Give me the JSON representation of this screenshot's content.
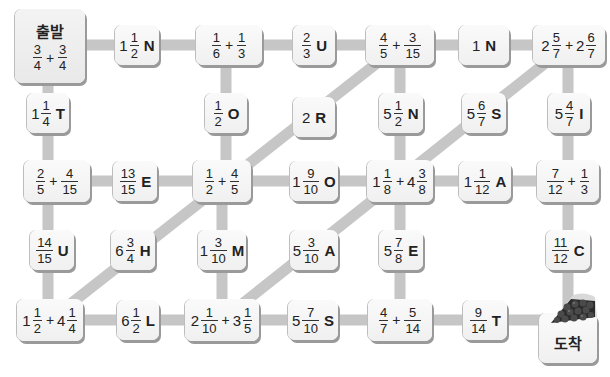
{
  "puzzle": {
    "start_label": "출발",
    "goal_label": "도착",
    "path_color": "#c6c6c6",
    "tile_color": "#f4f4f4",
    "shadow_color": "#9a9a9a"
  },
  "tiles": {
    "start": {
      "terms": [
        {
          "n": "3",
          "d": "4"
        },
        {
          "n": "3",
          "d": "4"
        }
      ]
    },
    "r1c2": {
      "whole": "1",
      "n": "1",
      "d": "2",
      "letter": "N"
    },
    "r1c3": {
      "terms": [
        {
          "n": "1",
          "d": "6"
        },
        {
          "n": "1",
          "d": "3"
        }
      ]
    },
    "r1c4": {
      "n": "2",
      "d": "3",
      "letter": "U"
    },
    "r1c5": {
      "terms": [
        {
          "n": "4",
          "d": "5"
        },
        {
          "n": "3",
          "d": "15"
        }
      ]
    },
    "r1c6": {
      "whole": "1",
      "letter": "N"
    },
    "r1c7": {
      "terms": [
        {
          "whole": "2",
          "n": "5",
          "d": "7"
        },
        {
          "whole": "2",
          "n": "6",
          "d": "7"
        }
      ]
    },
    "r2c1": {
      "whole": "1",
      "n": "1",
      "d": "4",
      "letter": "T"
    },
    "r2c3": {
      "n": "1",
      "d": "2",
      "letter": "O"
    },
    "r2c4": {
      "whole": "2",
      "letter": "R"
    },
    "r2c5": {
      "whole": "5",
      "n": "1",
      "d": "2",
      "letter": "N"
    },
    "r2c6": {
      "whole": "5",
      "n": "6",
      "d": "7",
      "letter": "S"
    },
    "r2c7": {
      "whole": "5",
      "n": "4",
      "d": "7",
      "letter": "I"
    },
    "r3c1": {
      "terms": [
        {
          "n": "2",
          "d": "5"
        },
        {
          "n": "4",
          "d": "15"
        }
      ]
    },
    "r3c2": {
      "n": "13",
      "d": "15",
      "letter": "E"
    },
    "r3c3": {
      "terms": [
        {
          "n": "1",
          "d": "2"
        },
        {
          "n": "4",
          "d": "5"
        }
      ]
    },
    "r3c4": {
      "whole": "1",
      "n": "9",
      "d": "10",
      "letter": "O"
    },
    "r3c5": {
      "terms": [
        {
          "whole": "1",
          "n": "1",
          "d": "8"
        },
        {
          "whole": "4",
          "n": "3",
          "d": "8"
        }
      ]
    },
    "r3c6": {
      "whole": "1",
      "n": "1",
      "d": "12",
      "letter": "A"
    },
    "r3c7": {
      "terms": [
        {
          "n": "7",
          "d": "12"
        },
        {
          "n": "1",
          "d": "3"
        }
      ]
    },
    "r4c1": {
      "n": "14",
      "d": "15",
      "letter": "U"
    },
    "r4c2": {
      "whole": "6",
      "n": "3",
      "d": "4",
      "letter": "H"
    },
    "r4c3": {
      "whole": "1",
      "n": "3",
      "d": "10",
      "letter": "M"
    },
    "r4c4": {
      "whole": "5",
      "n": "3",
      "d": "10",
      "letter": "A"
    },
    "r4c5": {
      "whole": "5",
      "n": "7",
      "d": "8",
      "letter": "E"
    },
    "r4c7": {
      "n": "11",
      "d": "12",
      "letter": "C"
    },
    "r5c1": {
      "terms": [
        {
          "whole": "1",
          "n": "1",
          "d": "2"
        },
        {
          "whole": "4",
          "n": "1",
          "d": "4"
        }
      ]
    },
    "r5c2": {
      "whole": "6",
      "n": "1",
      "d": "2",
      "letter": "L"
    },
    "r5c3": {
      "terms": [
        {
          "whole": "2",
          "n": "1",
          "d": "10"
        },
        {
          "whole": "3",
          "n": "1",
          "d": "5"
        }
      ]
    },
    "r5c4": {
      "whole": "5",
      "n": "7",
      "d": "10",
      "letter": "S"
    },
    "r5c5": {
      "terms": [
        {
          "n": "4",
          "d": "7"
        },
        {
          "n": "5",
          "d": "14"
        }
      ]
    },
    "r5c6": {
      "n": "9",
      "d": "14",
      "letter": "T"
    }
  }
}
